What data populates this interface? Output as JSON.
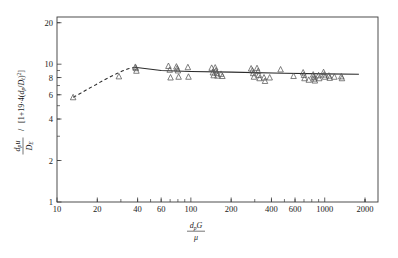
{
  "chart_data": {
    "type": "scatter",
    "title": "",
    "subtitle": "",
    "xlabel": "dpG / μ",
    "ylabel": "dpu / DE  /  [1+19.4(dp/Dt)²]",
    "xscale": "log",
    "yscale": "log",
    "xlim": [
      10,
      2500
    ],
    "ylim": [
      1,
      22
    ],
    "grid": false,
    "legend": null,
    "xticks": [
      10,
      20,
      40,
      60,
      100,
      200,
      400,
      600,
      1000,
      2000
    ],
    "xticklabels": [
      "10",
      "20",
      "40",
      "60",
      "100",
      "200",
      "400",
      "600",
      "1000",
      "2000"
    ],
    "yticks": [
      1,
      2,
      4,
      6,
      8,
      10,
      20
    ],
    "yticklabels": [
      "1",
      "2",
      "4",
      "6",
      "8",
      "10",
      "20"
    ],
    "marker": "triangle-up-open",
    "marker_color": "#555555",
    "line_color": "#2b2b2b",
    "series": [
      {
        "name": "data",
        "marker": "triangle",
        "points": [
          [
            13.2,
            5.75
          ],
          [
            29.0,
            8.15
          ],
          [
            38.5,
            9.55
          ],
          [
            38.8,
            9.35
          ],
          [
            39.2,
            8.95
          ],
          [
            68.0,
            9.7
          ],
          [
            69.5,
            9.1
          ],
          [
            70.5,
            8.0
          ],
          [
            78.0,
            9.6
          ],
          [
            79.0,
            9.3
          ],
          [
            80.0,
            9.0
          ],
          [
            81.0,
            8.1
          ],
          [
            95.0,
            9.5
          ],
          [
            96.0,
            8.1
          ],
          [
            143.0,
            9.4
          ],
          [
            146.0,
            8.7
          ],
          [
            148.0,
            8.3
          ],
          [
            152.0,
            9.45
          ],
          [
            154.0,
            9.0
          ],
          [
            156.0,
            8.6
          ],
          [
            158.0,
            8.25
          ],
          [
            168.0,
            8.5
          ],
          [
            172.0,
            8.2
          ],
          [
            282.0,
            9.3
          ],
          [
            288.0,
            9.0
          ],
          [
            292.0,
            8.6
          ],
          [
            296.0,
            8.1
          ],
          [
            312.0,
            9.35
          ],
          [
            318.0,
            8.9
          ],
          [
            322.0,
            8.35
          ],
          [
            326.0,
            7.9
          ],
          [
            352.0,
            8.0
          ],
          [
            358.0,
            7.55
          ],
          [
            388.0,
            8.0
          ],
          [
            468.0,
            9.15
          ],
          [
            585.0,
            8.2
          ],
          [
            690.0,
            8.7
          ],
          [
            700.0,
            8.35
          ],
          [
            706.0,
            7.9
          ],
          [
            760.0,
            7.7
          ],
          [
            820.0,
            8.4
          ],
          [
            828.0,
            8.1
          ],
          [
            836.0,
            7.85
          ],
          [
            844.0,
            7.6
          ],
          [
            900.0,
            8.3
          ],
          [
            910.0,
            7.9
          ],
          [
            980.0,
            8.75
          ],
          [
            992.0,
            8.4
          ],
          [
            1005.0,
            8.1
          ],
          [
            1075.0,
            8.25
          ],
          [
            1090.0,
            7.95
          ],
          [
            1180.0,
            8.1
          ],
          [
            1330.0,
            8.15
          ],
          [
            1345.0,
            7.9
          ]
        ]
      }
    ],
    "fit_line": {
      "style": "solid",
      "comment": "near-horizontal asymptote",
      "points": [
        [
          38.0,
          9.5
        ],
        [
          60.0,
          9.0
        ],
        [
          100.0,
          8.85
        ],
        [
          200.0,
          8.75
        ],
        [
          500.0,
          8.6
        ],
        [
          1000.0,
          8.5
        ],
        [
          1800.0,
          8.45
        ]
      ]
    },
    "dashed_curve": {
      "style": "dashed",
      "points": [
        [
          13.2,
          5.75
        ],
        [
          15.0,
          6.15
        ],
        [
          17.0,
          6.6
        ],
        [
          19.5,
          7.1
        ],
        [
          22.0,
          7.6
        ],
        [
          25.0,
          8.1
        ],
        [
          28.0,
          8.55
        ],
        [
          31.0,
          8.95
        ],
        [
          34.0,
          9.25
        ],
        [
          38.0,
          9.5
        ]
      ]
    }
  },
  "figure": {
    "x_axis_title_parts": {
      "numerator": "d",
      "numerator_sub": "p",
      "numerator_tail": "G",
      "denominator": "μ"
    },
    "y_axis_title_parts": {
      "num1": "d",
      "num1_sub": "p",
      "num1_tail": "u",
      "den1": "D",
      "den1_sub": "E",
      "bracket": "[1+19·4(d",
      "bracket_sub": "p",
      "bracket_mid": "/D",
      "bracket_sub2": "t",
      "bracket_tail": ")²]"
    }
  }
}
